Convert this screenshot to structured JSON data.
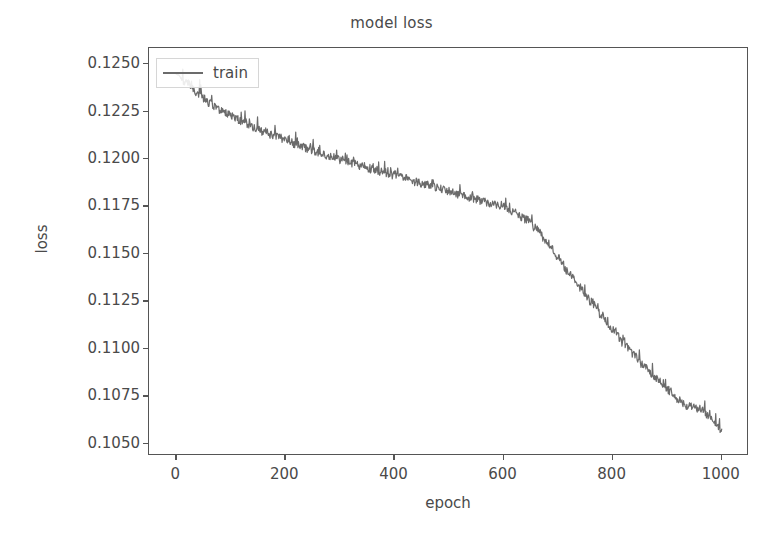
{
  "chart_data": {
    "type": "line",
    "title": "model loss",
    "xlabel": "epoch",
    "ylabel": "loss",
    "xlim": [
      -50,
      1050
    ],
    "ylim": [
      0.10435,
      0.12585
    ],
    "grid": false,
    "legend_position": "upper left",
    "xticks": [
      0,
      200,
      400,
      600,
      800,
      1000
    ],
    "xtick_labels": [
      "0",
      "200",
      "400",
      "600",
      "800",
      "1000"
    ],
    "yticks": [
      0.105,
      0.1075,
      0.11,
      0.1125,
      0.115,
      0.1175,
      0.12,
      0.1225,
      0.125
    ],
    "ytick_labels": [
      "0.1050",
      "0.1075",
      "0.1100",
      "0.1125",
      "0.1150",
      "0.1175",
      "0.1200",
      "0.1225",
      "0.1250"
    ],
    "series": [
      {
        "name": "train",
        "color": "#6b6b6b",
        "linewidth": 1.2,
        "x": [
          0,
          20,
          40,
          60,
          80,
          100,
          120,
          140,
          160,
          180,
          200,
          220,
          240,
          260,
          280,
          300,
          320,
          340,
          360,
          380,
          400,
          420,
          440,
          460,
          480,
          500,
          520,
          540,
          560,
          580,
          600,
          620,
          640,
          660,
          680,
          700,
          720,
          740,
          760,
          780,
          800,
          820,
          840,
          860,
          880,
          900,
          920,
          940,
          960,
          980,
          1000
        ],
        "values": [
          0.12445,
          0.12395,
          0.12345,
          0.12295,
          0.12258,
          0.12228,
          0.12198,
          0.12168,
          0.12142,
          0.12118,
          0.12098,
          0.12075,
          0.12053,
          0.12032,
          0.12012,
          0.11995,
          0.11978,
          0.11962,
          0.11945,
          0.11928,
          0.11912,
          0.11895,
          0.11878,
          0.11862,
          0.11845,
          0.11828,
          0.11812,
          0.11795,
          0.11778,
          0.11762,
          0.11745,
          0.11718,
          0.11682,
          0.11632,
          0.11558,
          0.11478,
          0.11398,
          0.11322,
          0.11248,
          0.11172,
          0.11098,
          0.11028,
          0.10962,
          0.10898,
          0.10838,
          0.10782,
          0.10732,
          0.10692,
          0.10682,
          0.10638,
          0.10572
        ],
        "noise": {
          "band": 0.00022,
          "spike_probability": 0.1,
          "spike_height": 0.00085,
          "description": "high-frequency downward-biased jitter with occasional upward spikes"
        }
      }
    ]
  },
  "legend": {
    "entries": [
      {
        "label": "train",
        "color": "#6b6b6b"
      }
    ]
  },
  "colors": {
    "background": "#ffffff",
    "axis": "#555555",
    "text": "#4a4a4a",
    "line": "#6b6b6b"
  }
}
